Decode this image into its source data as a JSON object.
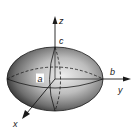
{
  "diagram": {
    "type": "ellipsoid",
    "axes": {
      "x": "x",
      "y": "y",
      "z": "z"
    },
    "semi_axes": {
      "a": "a",
      "b": "b",
      "c": "c"
    },
    "colors": {
      "shading_dark": "#3a3a3a",
      "shading_light": "#e6e6e6",
      "lines": "#1a1a1a"
    }
  }
}
